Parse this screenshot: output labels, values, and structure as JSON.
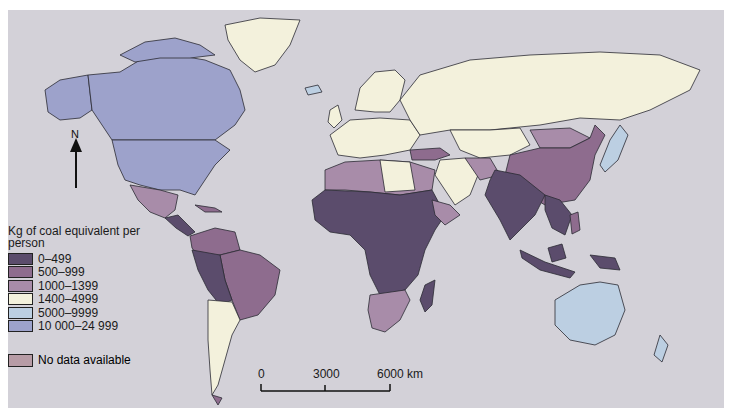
{
  "legend": {
    "title": "Kg of coal equivalent per person",
    "items": [
      {
        "label": "0–499",
        "color": "#5b4c6c"
      },
      {
        "label": "500–999",
        "color": "#8e6c8e"
      },
      {
        "label": "1000–1399",
        "color": "#a88ca9"
      },
      {
        "label": "1400–4999",
        "color": "#f3f1dc"
      },
      {
        "label": "5000–9999",
        "color": "#bccfe2"
      },
      {
        "label": "10 000–24 999",
        "color": "#9da2cb"
      }
    ],
    "no_data": {
      "label": "No data available",
      "color": "#b79ca6"
    }
  },
  "scale_bar": {
    "ticks": [
      "0",
      "3000",
      "6000 km"
    ]
  },
  "north_arrow": {
    "label": "N",
    "icon": "north-arrow-icon"
  },
  "colors": {
    "ocean": "#d3d1d8",
    "border": "#2b2b33"
  },
  "regions": {
    "north_america_usa_canada": "10 000–24 999",
    "greenland": "No data available",
    "russia": "1400–4999",
    "europe": "1400–4999",
    "china": "500–999",
    "india": "0–499",
    "africa_central": "0–499",
    "north_africa": "1000–1399",
    "south_america": "500–999",
    "australia": "5000–9999",
    "japan": "5000–9999"
  }
}
